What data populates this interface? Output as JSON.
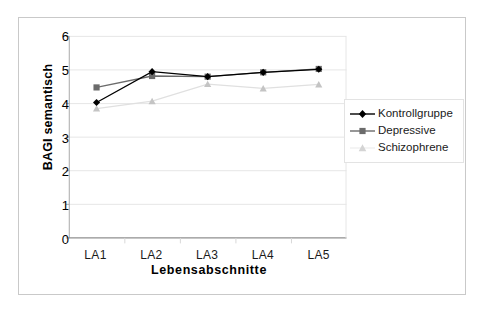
{
  "chart_data": {
    "type": "line",
    "title": "",
    "xlabel": "Lebensabschnitte",
    "ylabel": "BAGI semantisch",
    "categories": [
      "LA1",
      "LA2",
      "LA3",
      "LA4",
      "LA5"
    ],
    "ylim": [
      0,
      6
    ],
    "yticks": [
      0,
      1,
      2,
      3,
      4,
      5,
      6
    ],
    "grid": true,
    "legend_position": "right",
    "series": [
      {
        "name": "Kontrollgruppe",
        "values": [
          4.03,
          4.95,
          4.8,
          4.93,
          5.02
        ],
        "color": "#000000",
        "marker": "diamond"
      },
      {
        "name": "Depressive",
        "values": [
          4.48,
          4.82,
          4.8,
          4.93,
          5.03
        ],
        "color": "#6b6b6b",
        "marker": "square"
      },
      {
        "name": "Schizophrene",
        "values": [
          3.85,
          4.07,
          4.58,
          4.45,
          4.57
        ],
        "color": "#cfcfcf",
        "marker": "triangle"
      }
    ]
  },
  "axes": {
    "y_tick_labels": [
      "6",
      "5",
      "4",
      "3",
      "2",
      "1",
      "0"
    ],
    "x_tick_labels": [
      "LA1",
      "LA2",
      "LA3",
      "LA4",
      "LA5"
    ],
    "y_title": "BAGI semantisch",
    "x_title": "Lebensabschnitte"
  },
  "legend": {
    "items": [
      {
        "label": "Kontrollgruppe",
        "color": "#000000",
        "marker": "diamond"
      },
      {
        "label": "Depressive",
        "color": "#6b6b6b",
        "marker": "square"
      },
      {
        "label": "Schizophrene",
        "color": "#cfcfcf",
        "marker": "triangle"
      }
    ]
  },
  "colors": {
    "frame": "#c9c9c9",
    "grid": "#e6e6e6",
    "axis": "#a8a8a8",
    "background": "#ffffff",
    "series_kontrollgruppe": "#000000",
    "series_depressive": "#6b6b6b",
    "series_schizophrene": "#cfcfcf"
  }
}
